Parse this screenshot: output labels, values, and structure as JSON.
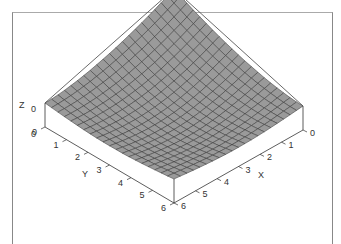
{
  "chart_data": {
    "type": "surface3d",
    "title": "",
    "xlabel": "X",
    "ylabel": "Y",
    "zlabel": "Z",
    "x_ticks": [
      "0",
      "1",
      "2",
      "3",
      "4",
      "5",
      "6"
    ],
    "y_ticks": [
      "0",
      "1",
      "2",
      "3",
      "4",
      "5",
      "6"
    ],
    "z_ticks": [
      "0",
      "0"
    ],
    "xlim": [
      0,
      6
    ],
    "ylim": [
      0,
      6
    ],
    "grid_size": 20,
    "surface_color": "#9a9a9a",
    "mesh_color": "#333333"
  }
}
